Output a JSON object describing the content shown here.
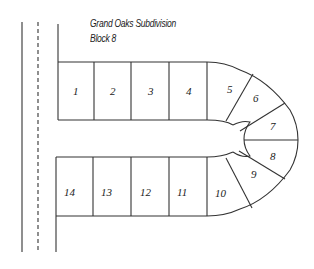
{
  "map": {
    "title": "Grand Oaks Subdivision",
    "subtitle": "Block 8"
  },
  "lots": [
    {
      "number": "1"
    },
    {
      "number": "2"
    },
    {
      "number": "3"
    },
    {
      "number": "4"
    },
    {
      "number": "5"
    },
    {
      "number": "6"
    },
    {
      "number": "7"
    },
    {
      "number": "8"
    },
    {
      "number": "9"
    },
    {
      "number": "10"
    },
    {
      "number": "11"
    },
    {
      "number": "12"
    },
    {
      "number": "13"
    },
    {
      "number": "14"
    }
  ],
  "colors": {
    "line": "#333333",
    "background": "#ffffff"
  }
}
